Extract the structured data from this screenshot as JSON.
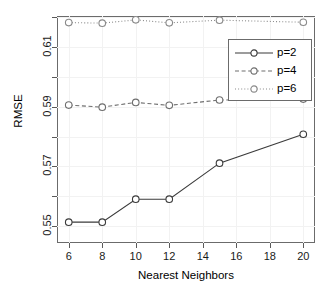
{
  "chart_data": {
    "type": "line",
    "title": "",
    "xlabel": "Nearest Neighbors",
    "ylabel": "RMSE",
    "x": [
      6,
      8,
      10,
      12,
      15,
      20
    ],
    "xlim": [
      5.3,
      20.7
    ],
    "ylim": [
      0.5443,
      0.6205
    ],
    "xticks": [
      6,
      8,
      10,
      12,
      14,
      16,
      18,
      20
    ],
    "xtick_labels": [
      "6",
      "8",
      "10",
      "12",
      "14",
      "16",
      "18",
      "20"
    ],
    "yticks": [
      0.55,
      0.57,
      0.59,
      0.61
    ],
    "ytick_labels": [
      "0.55",
      "0.57",
      "0.59",
      "0.61"
    ],
    "yticks_minor": [
      0.56,
      0.58,
      0.6,
      0.62
    ],
    "grid": true,
    "legend_position": "top-right",
    "series": [
      {
        "name": "p=2",
        "linestyle": "solid",
        "marker": "open-circle",
        "color": "#3b3b3b",
        "values": [
          0.5513,
          0.5513,
          0.559,
          0.559,
          0.5711,
          0.5808
        ]
      },
      {
        "name": "p=4",
        "linestyle": "dashed",
        "marker": "open-circle",
        "color": "#6e6e6e",
        "values": [
          0.5906,
          0.5899,
          0.5915,
          0.5905,
          0.5923,
          0.5926
        ]
      },
      {
        "name": "p=6",
        "linestyle": "dotted",
        "marker": "open-circle",
        "color": "#8a8a8a",
        "values": [
          0.6183,
          0.6181,
          0.6192,
          0.6182,
          0.6191,
          0.6184
        ]
      }
    ]
  },
  "legend": {
    "items": [
      {
        "label": "p=2"
      },
      {
        "label": "p=4"
      },
      {
        "label": "p=6"
      }
    ]
  }
}
